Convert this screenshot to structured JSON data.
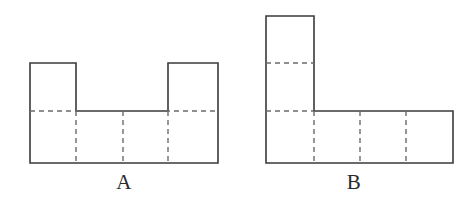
{
  "page": {
    "background_color": "#ffffff",
    "stroke_color": "#3a3a3a",
    "dash_color": "#6b6b6b",
    "solid_stroke_width": 1.6,
    "dash_stroke_width": 1.4,
    "dash_pattern": "5,4"
  },
  "figures": [
    {
      "id": "figure-a",
      "label": "A",
      "shape_name": "notched-rectangle-net",
      "label_x": 120,
      "label_y": 186,
      "outline_points": "30,63 76,63 76,111 168,111 168,63 218,63 218,163 30,163",
      "bounds": {
        "x0": 30,
        "y0": 63,
        "x1": 218,
        "y1": 163
      },
      "dashed_horizontals": [
        {
          "x0": 30,
          "x1": 218,
          "y": 111
        }
      ],
      "dashed_verticals": [
        {
          "x": 76,
          "y0": 111,
          "y1": 163
        },
        {
          "x": 123,
          "y0": 111,
          "y1": 163
        },
        {
          "x": 168,
          "y0": 111,
          "y1": 163
        }
      ],
      "cell_columns": 4,
      "cell_rows": 2
    },
    {
      "id": "figure-b",
      "label": "B",
      "shape_name": "L-shape-net",
      "label_x": 354,
      "label_y": 186,
      "outline_points": "266,16 314,16 314,111 453,111 453,163 266,163",
      "bounds": {
        "x0": 266,
        "y0": 16,
        "x1": 453,
        "y1": 163
      },
      "dashed_horizontals": [
        {
          "x0": 266,
          "x1": 314,
          "y": 63
        },
        {
          "x0": 266,
          "x1": 314,
          "y": 111
        }
      ],
      "dashed_verticals": [
        {
          "x": 314,
          "y0": 111,
          "y1": 163
        },
        {
          "x": 360,
          "y0": 111,
          "y1": 163
        },
        {
          "x": 406,
          "y0": 111,
          "y1": 163
        }
      ],
      "cell_columns": 4,
      "cell_rows": 3
    }
  ]
}
